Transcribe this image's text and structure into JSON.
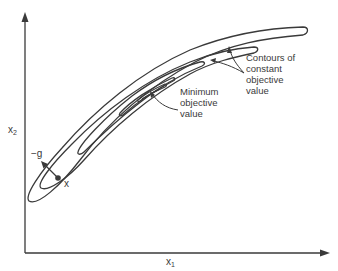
{
  "diagram": {
    "axes": {
      "x_label": "x",
      "x_subscript": "1",
      "y_label": "x",
      "y_subscript": "2"
    },
    "annotations": {
      "point_label": "x",
      "gradient_label": "−g",
      "minimum_line1": "Minimum",
      "minimum_line2": "objective",
      "minimum_line3": "value",
      "contours_line1": "Contours of",
      "contours_line2": "constant",
      "contours_line3": "objective",
      "contours_line4": "value"
    },
    "colors": {
      "stroke": "#3a3a3a",
      "background": "#ffffff"
    }
  }
}
